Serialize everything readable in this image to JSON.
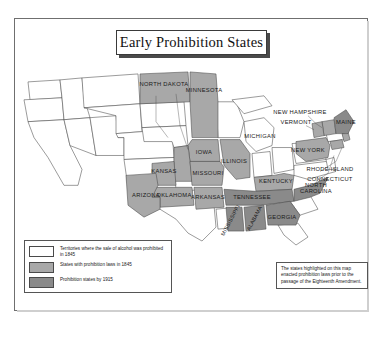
{
  "title": "Early Prohibition States",
  "legend": {
    "items": [
      {
        "swatch": "white",
        "label": "Territories where the sale of alcohol was prohibited in 1845"
      },
      {
        "swatch": "mid",
        "label": "States with prohibition laws in 1845"
      },
      {
        "swatch": "dark",
        "label": "Prohibition states by 1915"
      }
    ]
  },
  "note": {
    "text": "The states highlighted on this map enacted prohibition laws prior to the passage of the Eighteenth Amendment."
  },
  "colors": {
    "mid_gray": "#a8a8a8",
    "dark_gray": "#8a8a8a",
    "unshaded": "#ffffff",
    "outline": "#4a4a4a"
  },
  "map": {
    "labels": [
      {
        "id": "north-dakota",
        "name": "NORTH DAKOTA",
        "shade": "mid"
      },
      {
        "id": "minnesota",
        "name": "MINNESOTA",
        "shade": "mid"
      },
      {
        "id": "iowa",
        "name": "IOWA",
        "shade": "mid"
      },
      {
        "id": "illinois",
        "name": "ILLINOIS",
        "shade": "mid"
      },
      {
        "id": "michigan",
        "name": "MICHIGAN",
        "shade": "white"
      },
      {
        "id": "kansas",
        "name": "KANSAS",
        "shade": "mid"
      },
      {
        "id": "missouri",
        "name": "MISSOURI",
        "shade": "mid"
      },
      {
        "id": "oklahoma",
        "name": "OKLAHOMA",
        "shade": "mid"
      },
      {
        "id": "arkansas",
        "name": "ARKANSAS",
        "shade": "mid"
      },
      {
        "id": "tennessee",
        "name": "TENNESSEE",
        "shade": "dark"
      },
      {
        "id": "kentucky",
        "name": "KENTUCKY",
        "shade": "mid"
      },
      {
        "id": "mississippi",
        "name": "MISSISSIPPI",
        "shade": "dark"
      },
      {
        "id": "alabama",
        "name": "ALABAMA",
        "shade": "dark"
      },
      {
        "id": "georgia",
        "name": "GEORGIA",
        "shade": "dark"
      },
      {
        "id": "north-carolina",
        "name": "NORTH CAROLINA",
        "shade": "dark"
      },
      {
        "id": "arizona",
        "name": "ARIZONA",
        "shade": "mid"
      },
      {
        "id": "new-york",
        "name": "NEW YORK",
        "shade": "mid"
      },
      {
        "id": "new-hampshire",
        "name": "NEW HAMPSHIRE",
        "shade": "mid"
      },
      {
        "id": "vermont",
        "name": "VERMONT",
        "shade": "mid"
      },
      {
        "id": "maine",
        "name": "MAINE",
        "shade": "dark"
      },
      {
        "id": "rhode-island",
        "name": "RHODE ISLAND",
        "shade": "mid"
      },
      {
        "id": "connecticut",
        "name": "CONNECTICUT",
        "shade": "mid"
      }
    ]
  }
}
